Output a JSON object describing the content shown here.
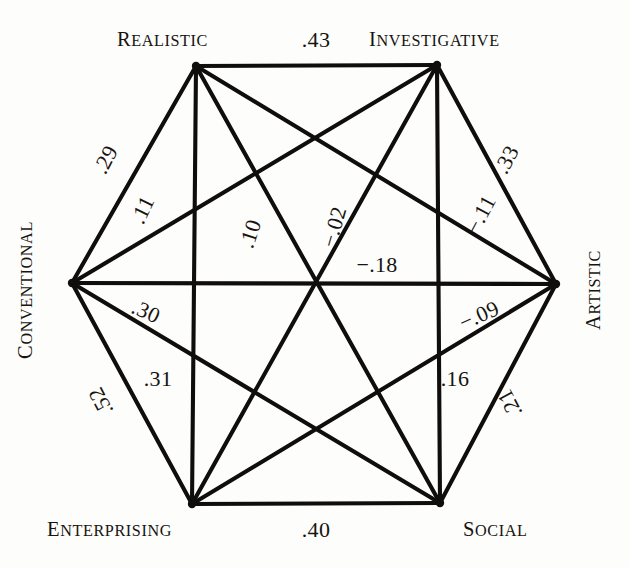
{
  "figure": {
    "type": "hexagon-correlation-diagram",
    "background_color": "#fdfdfc",
    "line_color": "#100e0c",
    "text_color": "#17140f"
  },
  "vertices": [
    {
      "id": "realistic",
      "label": "Realistic",
      "x": 196,
      "y": 66,
      "label_x": 208,
      "label_y": 46,
      "anchor": "end",
      "rotation": 0
    },
    {
      "id": "investigative",
      "label": "Investigative",
      "x": 437,
      "y": 65,
      "label_x": 369,
      "label_y": 46,
      "anchor": "start",
      "rotation": 0
    },
    {
      "id": "artistic",
      "label": "Artistic",
      "x": 556,
      "y": 284,
      "label_x": 600,
      "label_y": 290,
      "anchor": "middle",
      "rotation": -90
    },
    {
      "id": "social",
      "label": "Social",
      "x": 440,
      "y": 503,
      "label_x": 463,
      "label_y": 536,
      "anchor": "start",
      "rotation": 0
    },
    {
      "id": "enterprising",
      "label": "Enterprising",
      "x": 192,
      "y": 504,
      "label_x": 172,
      "label_y": 536,
      "anchor": "end",
      "rotation": 0
    },
    {
      "id": "conventional",
      "label": "Conventional",
      "x": 72,
      "y": 283,
      "label_x": 32,
      "label_y": 290,
      "anchor": "middle",
      "rotation": -90
    }
  ],
  "edges": [
    {
      "id": "realistic-investigative",
      "from": "realistic",
      "to": "investigative",
      "value": ".43",
      "label_x": 316,
      "label_y": 47,
      "rotation": 0
    },
    {
      "id": "investigative-artistic",
      "from": "investigative",
      "to": "artistic",
      "value": ".33",
      "label_x": 513,
      "label_y": 163,
      "rotation": -62
    },
    {
      "id": "artistic-social",
      "from": "artistic",
      "to": "social",
      "value": ".21",
      "label_x": 516,
      "label_y": 400,
      "rotation": -118
    },
    {
      "id": "social-enterprising",
      "from": "social",
      "to": "enterprising",
      "value": ".40",
      "label_x": 316,
      "label_y": 537,
      "rotation": 0
    },
    {
      "id": "enterprising-conventional",
      "from": "enterprising",
      "to": "conventional",
      "value": ".52",
      "label_x": 107,
      "label_y": 398,
      "rotation": -118
    },
    {
      "id": "conventional-realistic",
      "from": "conventional",
      "to": "realistic",
      "value": ".29",
      "label_x": 112,
      "label_y": 163,
      "rotation": -62
    },
    {
      "id": "conventional-investigative",
      "from": "conventional",
      "to": "investigative",
      "value": ".11",
      "label_x": 149,
      "label_y": 213,
      "rotation": -64
    },
    {
      "id": "realistic-artistic",
      "from": "realistic",
      "to": "artistic",
      "value": "−.11",
      "label_x": 487,
      "label_y": 218,
      "rotation": -62
    },
    {
      "id": "realistic-social",
      "from": "realistic",
      "to": "social",
      "value": ".10",
      "label_x": 257,
      "label_y": 236,
      "rotation": -72
    },
    {
      "id": "investigative-enterprising",
      "from": "investigative",
      "to": "enterprising",
      "value": "−.02",
      "label_x": 341,
      "label_y": 229,
      "rotation": -74
    },
    {
      "id": "conventional-artistic",
      "from": "conventional",
      "to": "artistic",
      "value": "−.18",
      "label_x": 377,
      "label_y": 272,
      "rotation": 0
    },
    {
      "id": "conventional-social",
      "from": "conventional",
      "to": "social",
      "value": "−.09",
      "label_x": 482,
      "label_y": 322,
      "rotation": -24
    },
    {
      "id": "enterprising-artistic",
      "from": "enterprising",
      "to": "artistic",
      "value": ".30",
      "label_x": 143,
      "label_y": 318,
      "rotation": 24
    },
    {
      "id": "realistic-enterprising",
      "from": "realistic",
      "to": "enterprising",
      "value": ".31",
      "label_x": 158,
      "label_y": 386,
      "rotation": 0
    },
    {
      "id": "investigative-social",
      "from": "investigative",
      "to": "social",
      "value": ".16",
      "label_x": 455,
      "label_y": 386,
      "rotation": 0
    }
  ]
}
